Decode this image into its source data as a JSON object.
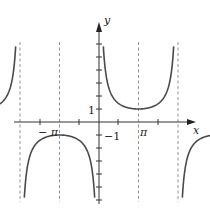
{
  "chart_data": {
    "type": "line",
    "function": "y = csc(x)",
    "title": "",
    "xlabel": "x",
    "ylabel": "y",
    "x_tick_labels": [
      {
        "value": "-pi",
        "text": "−π"
      },
      {
        "value": "pi",
        "text": "π"
      }
    ],
    "y_tick_labels": [
      {
        "value": 1,
        "text": "1"
      },
      {
        "value": -1,
        "text": "−1"
      }
    ],
    "xlim": [
      "-2pi",
      "2pi"
    ],
    "ylim": [
      -6,
      6
    ],
    "asymptotes_x": [
      "-2pi",
      "-pi",
      "0",
      "pi",
      "2pi"
    ],
    "local_extrema": [
      {
        "x": "-3pi/2",
        "y": 1
      },
      {
        "x": "-pi/2",
        "y": -1
      },
      {
        "x": "pi/2",
        "y": 1
      },
      {
        "x": "3pi/2",
        "y": -1
      }
    ],
    "grid": false,
    "legend": "none",
    "colors": {
      "curve": "#4a4a4a",
      "axis": "#333333",
      "asymptote": "#666666"
    }
  },
  "labels": {
    "x_axis": "x",
    "y_axis": "y",
    "neg_pi": "− π",
    "pos_pi": "π",
    "one": "1",
    "neg_one": "−1"
  }
}
